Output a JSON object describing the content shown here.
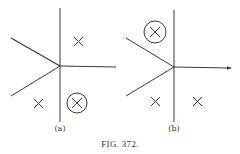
{
  "figure": {
    "caption": "FIG. 372.",
    "panels": [
      {
        "label": "(a)",
        "marks": [
          "cross-upper-right",
          "cross-lower-left",
          "circled-cross-lower-right"
        ]
      },
      {
        "label": "(b)",
        "marks": [
          "circled-cross-upper-left",
          "cross-lower-left",
          "cross-lower-right"
        ]
      }
    ]
  },
  "colors": {
    "ink": "#3a3a3a",
    "background": "#ffffff"
  }
}
